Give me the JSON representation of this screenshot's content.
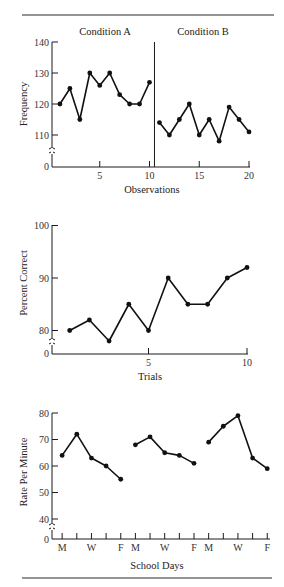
{
  "chart_data": [
    {
      "type": "line",
      "title": "",
      "xlabel": "Observations",
      "ylabel": "Frequency",
      "phases": [
        "Condition A",
        "Condition B"
      ],
      "phase_change_after": 10.5,
      "x": [
        1,
        2,
        3,
        4,
        5,
        6,
        7,
        8,
        9,
        10,
        11,
        12,
        13,
        14,
        15,
        16,
        17,
        18,
        19,
        20
      ],
      "series": [
        {
          "name": "Condition A",
          "x": [
            1,
            2,
            3,
            4,
            5,
            6,
            7,
            8,
            9,
            10
          ],
          "values": [
            120,
            125,
            115,
            130,
            126,
            130,
            123,
            120,
            120,
            127
          ]
        },
        {
          "name": "Condition B",
          "x": [
            11,
            12,
            13,
            14,
            15,
            16,
            17,
            18,
            19,
            20
          ],
          "values": [
            114,
            110,
            115,
            120,
            110,
            115,
            108,
            119,
            115,
            111
          ]
        }
      ],
      "yticks": [
        0,
        110,
        120,
        130,
        140
      ],
      "xticks": [
        5,
        10,
        15,
        20
      ],
      "ylim": [
        0,
        140
      ],
      "axis_break": true,
      "grid": false
    },
    {
      "type": "line",
      "title": "",
      "xlabel": "Trials",
      "ylabel": "Percent Correct",
      "x": [
        1,
        2,
        3,
        4,
        5,
        6,
        7,
        8,
        9,
        10
      ],
      "series": [
        {
          "name": "Percent Correct",
          "x": [
            1,
            2,
            3,
            4,
            5,
            6,
            7,
            8,
            9,
            10
          ],
          "values": [
            80,
            82,
            78,
            85,
            80,
            90,
            85,
            85,
            90,
            92
          ]
        }
      ],
      "yticks": [
        0,
        80,
        90,
        100
      ],
      "xticks": [
        5,
        10
      ],
      "ylim": [
        0,
        100
      ],
      "axis_break": true,
      "grid": false
    },
    {
      "type": "line",
      "title": "",
      "xlabel": "School Days",
      "ylabel": "Rate Per Minute",
      "categories": [
        "M",
        "T",
        "W",
        "Th",
        "F",
        "M",
        "T",
        "W",
        "Th",
        "F",
        "M",
        "T",
        "W",
        "Th",
        "F"
      ],
      "xtick_labels": [
        "M",
        "",
        "W",
        "",
        "F",
        "M",
        "",
        "W",
        "",
        "F",
        "M",
        "",
        "W",
        "",
        "F"
      ],
      "series": [
        {
          "name": "Week 1",
          "x": [
            1,
            2,
            3,
            4,
            5
          ],
          "values": [
            64,
            72,
            63,
            60,
            55
          ]
        },
        {
          "name": "Week 2",
          "x": [
            6,
            7,
            8,
            9,
            10
          ],
          "values": [
            68,
            71,
            65,
            64,
            61
          ]
        },
        {
          "name": "Week 3",
          "x": [
            11,
            12,
            13,
            14,
            15
          ],
          "values": [
            69,
            75,
            79,
            63,
            59
          ]
        }
      ],
      "yticks": [
        0,
        40,
        50,
        60,
        70,
        80
      ],
      "ylim": [
        0,
        80
      ],
      "axis_break": true,
      "grid": false
    }
  ],
  "labels": {
    "chart1": {
      "phase_a": "Condition A",
      "phase_b": "Condition B",
      "ylabel": "Frequency",
      "xlabel": "Observations"
    },
    "chart2": {
      "ylabel": "Percent Correct",
      "xlabel": "Trials"
    },
    "chart3": {
      "ylabel": "Rate Per Minute",
      "xlabel": "School Days"
    }
  }
}
